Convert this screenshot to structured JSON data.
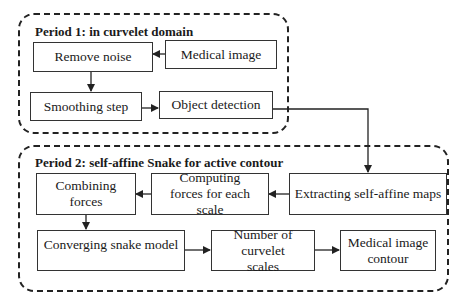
{
  "diagram": {
    "groups": [
      {
        "id": "period1",
        "title": "Period 1: in curvelet domain"
      },
      {
        "id": "period2",
        "title": "Period 2: self-affine Snake for active contour"
      }
    ],
    "nodes": {
      "medical_image": "Medical image",
      "remove_noise": "Remove noise",
      "smoothing_step": "Smoothing step",
      "object_detection": "Object detection",
      "extracting_maps": "Extracting self-affine maps",
      "computing_forces": "Computing forces for each scale",
      "combining_forces": "Combining forces",
      "converging_snake": "Converging snake model",
      "number_scales": "Number of curvelet scales",
      "contour": "Medical image contour"
    },
    "edges": [
      {
        "from": "Medical image",
        "to": "Remove noise"
      },
      {
        "from": "Remove noise",
        "to": "Smoothing step"
      },
      {
        "from": "Smoothing step",
        "to": "Object detection"
      },
      {
        "from": "Object detection",
        "to": "Extracting self-affine maps"
      },
      {
        "from": "Extracting self-affine maps",
        "to": "Computing forces for each scale"
      },
      {
        "from": "Computing forces for each scale",
        "to": "Combining forces"
      },
      {
        "from": "Combining forces",
        "to": "Converging snake model"
      },
      {
        "from": "Converging snake model",
        "to": "Number of curvelet scales"
      },
      {
        "from": "Number of curvelet scales",
        "to": "Medical image contour"
      }
    ]
  }
}
